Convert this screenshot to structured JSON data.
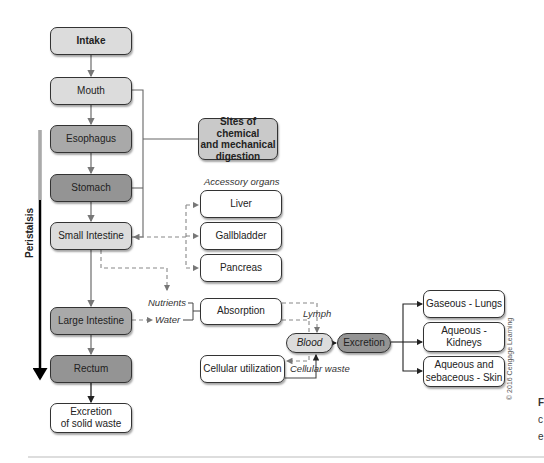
{
  "main_flow": {
    "intake": "Intake",
    "mouth": "Mouth",
    "esophagus": "Esophagus",
    "stomach": "Stomach",
    "small_intestine": "Small Intestine",
    "large_intestine": "Large Intestine",
    "rectum": "Rectum",
    "solid_waste_line1": "Excretion",
    "solid_waste_line2": "of solid waste"
  },
  "peristalsis_label": "Peristalsis",
  "sites_box": {
    "line1": "Sites of chemical",
    "line2": "and mechanical",
    "line3": "digestion"
  },
  "accessory": {
    "heading": "Accessory organs",
    "items": [
      "Liver",
      "Gallbladder",
      "Pancreas"
    ]
  },
  "absorption": {
    "nutrients": "Nutrients",
    "water": "Water",
    "absorption": "Absorption",
    "lymph": "Lymph",
    "blood": "Blood",
    "cellular_utilization": "Cellular utilization",
    "cellular_waste": "Cellular waste",
    "excretion": "Excretion"
  },
  "excretion_routes": {
    "lungs": "Gaseous - Lungs",
    "kidneys": "Aqueous - Kidneys",
    "skin_line1": "Aqueous and",
    "skin_line2": "sebaceous - Skin"
  },
  "copyright": "© 2016 Cengage Learning",
  "cutoff_text": [
    "F",
    "c",
    "e"
  ]
}
